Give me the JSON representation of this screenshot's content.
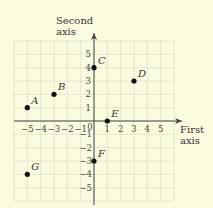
{
  "axes": {
    "x_label_line1": "First",
    "x_label_line2": "axis",
    "y_label_line1": "Second",
    "y_label_line2": "axis",
    "range": [
      -6,
      6
    ],
    "x_ticks": [
      "−5",
      "−4",
      "−3",
      "−2",
      "−1",
      "0",
      "1",
      "2",
      "3",
      "4",
      "5"
    ],
    "y_ticks_pos": [
      "5",
      "4",
      "3",
      "2",
      "1"
    ],
    "y_ticks_neg": [
      "−1",
      "−2",
      "−3",
      "−4",
      "−5"
    ]
  },
  "points": [
    {
      "label": "A",
      "x": -5,
      "y": 1
    },
    {
      "label": "B",
      "x": -3,
      "y": 2
    },
    {
      "label": "C",
      "x": 0,
      "y": 4
    },
    {
      "label": "D",
      "x": 3,
      "y": 3
    },
    {
      "label": "E",
      "x": 1,
      "y": 0
    },
    {
      "label": "F",
      "x": 0,
      "y": -3
    },
    {
      "label": "G",
      "x": -5,
      "y": -4
    }
  ],
  "colors": {
    "background": "#fbfbe0",
    "grid": "#cfcfbe",
    "axis": "#444444",
    "point": "#111111"
  }
}
